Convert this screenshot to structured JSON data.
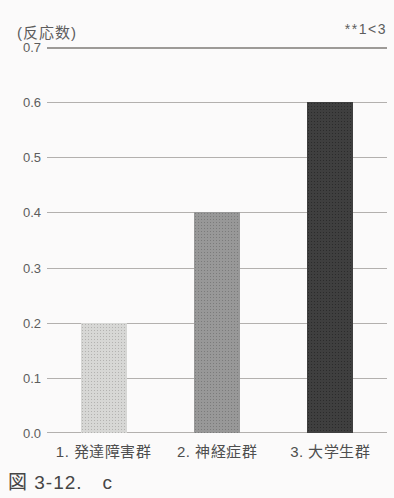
{
  "figure": {
    "unit_label": "(反応数)",
    "annotation": "**1<3",
    "caption": "図 3-12.　c"
  },
  "chart_data": {
    "type": "bar",
    "title": "",
    "ylabel": "(反応数)",
    "xlabel": "",
    "categories": [
      "1. 発達障害群",
      "2. 神経症群",
      "3. 大学生群"
    ],
    "values": [
      0.2,
      0.4,
      0.6
    ],
    "ylim": [
      0.0,
      0.7
    ],
    "ytick_interval": 0.1,
    "yticks": [
      "0.7",
      "0.6",
      "0.5",
      "0.4",
      "0.3",
      "0.2",
      "0.1",
      "0.0"
    ],
    "grid": true,
    "legend_position": "none",
    "annotation": "**1<3",
    "bar_colors": [
      "#d5d4d2",
      "#929292",
      "#333333"
    ],
    "caption": "図 3-12.　c"
  }
}
